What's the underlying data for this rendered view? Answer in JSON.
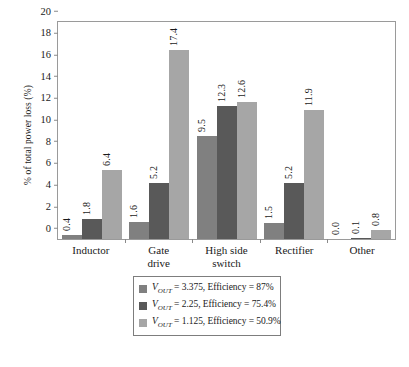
{
  "chart_data": {
    "type": "bar",
    "title": "",
    "subtitle": "",
    "xlabel": "",
    "ylabel": "% of total power loss (%)",
    "ylim": [
      0,
      20
    ],
    "yticks": [
      0,
      2,
      4,
      6,
      8,
      10,
      12,
      14,
      16,
      18,
      20
    ],
    "ytick_labels": [
      "0",
      "2",
      "4",
      "6",
      "8",
      "10",
      "12",
      "14",
      "16",
      "18",
      "20"
    ],
    "grid": false,
    "legend_position": "below",
    "categories": [
      "Inductor",
      "Gate drive",
      "High side switch",
      "Rectifier",
      "Other"
    ],
    "category_lines": [
      [
        "Inductor"
      ],
      [
        "Gate",
        "drive"
      ],
      [
        "High side",
        "switch"
      ],
      [
        "Rectifier"
      ],
      [
        "Other"
      ]
    ],
    "series": [
      {
        "name": "VOUT = 3.375, Efficiency = 87%",
        "color": "#808080",
        "values": [
          0.4,
          1.6,
          9.5,
          1.5,
          0.0
        ],
        "value_labels": [
          "0.4",
          "1.6",
          "9.5",
          "1.5",
          "0.0"
        ],
        "legend": {
          "symbol": "V",
          "subscript": "OUT",
          "rest": " = 3.375, Efficiency = 87%"
        }
      },
      {
        "name": "VOUT = 2.25, Efficiency = 75.4%",
        "color": "#595959",
        "values": [
          1.8,
          5.2,
          12.3,
          5.2,
          0.1
        ],
        "value_labels": [
          "1.8",
          "5.2",
          "12.3",
          "5.2",
          "0.1"
        ],
        "legend": {
          "symbol": "V",
          "subscript": "OUT",
          "rest": " = 2.25, Efficiency = 75.4%"
        }
      },
      {
        "name": "VOUT = 1.125, Efficiency = 50.9%",
        "color": "#a6a6a6",
        "values": [
          6.4,
          17.4,
          12.6,
          11.9,
          0.8
        ],
        "value_labels": [
          "6.4",
          "17.4",
          "12.6",
          "11.9",
          "0.8"
        ],
        "legend": {
          "symbol": "V",
          "subscript": "OUT",
          "rest": " = 1.125, Efficiency = 50.9%"
        }
      }
    ]
  },
  "colors": {
    "series_1": "#808080",
    "series_2": "#595959",
    "series_3": "#a6a6a6",
    "axis": "#9a9a9a",
    "text": "#1a1a1a",
    "legend_border": "#7d7d7d",
    "background": "#ffffff"
  }
}
